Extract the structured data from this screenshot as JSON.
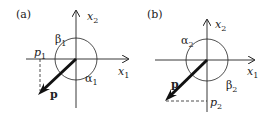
{
  "panels": [
    {
      "label": "(a)",
      "axis_x": {
        "name": "x",
        "sub": "1"
      },
      "axis_y": {
        "name": "x",
        "sub": "2"
      },
      "vector": "p",
      "projection": {
        "name": "p",
        "sub": "1"
      },
      "angle_upper": {
        "name": "β",
        "sub": "1"
      },
      "angle_lower": {
        "name": "α",
        "sub": "1"
      }
    },
    {
      "label": "(b)",
      "axis_x": {
        "name": "x",
        "sub": "1"
      },
      "axis_y": {
        "name": "x",
        "sub": "2"
      },
      "vector": "p",
      "projection": {
        "name": "p",
        "sub": "2"
      },
      "angle_upper": {
        "name": "α",
        "sub": "2"
      },
      "angle_lower": {
        "name": "β",
        "sub": "2"
      }
    }
  ],
  "colors": {
    "line": "#222222",
    "background": "#ffffff"
  }
}
